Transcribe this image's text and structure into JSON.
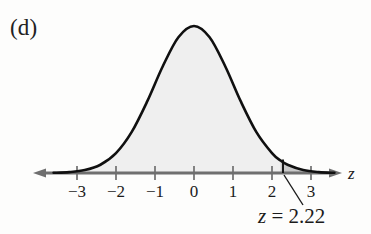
{
  "figure": {
    "panel_label": "(d)",
    "axis_label": "z",
    "annotation_variable": "z",
    "annotation_equals": "=",
    "annotation_value": "2.22",
    "annotation_full": "z = 2.22"
  },
  "colors": {
    "curve_stroke": "#101010",
    "curve_fill": "#efefef",
    "tail_fill": "#c9c9c9",
    "axis": "#6f6f6f",
    "tick": "#6f6f6f",
    "leader": "#1b1b1b",
    "text": "#1b1b1b",
    "background": "#fdfdfc"
  },
  "chart_data": {
    "type": "area",
    "title": "(d)",
    "xlabel": "z",
    "ylabel": "",
    "xlim": [
      -3.6,
      3.8
    ],
    "ylim": [
      0,
      0.42
    ],
    "grid": false,
    "legend": null,
    "distribution": "standard normal",
    "mean": 0,
    "sd": 1,
    "tick_values": [
      -3,
      -2,
      -1,
      0,
      1,
      2,
      3
    ],
    "tick_labels": [
      "−3",
      "−2",
      "−1",
      "0",
      "1",
      "2",
      "3"
    ],
    "shaded_region": {
      "label": "z = 2.22",
      "boundary_z": 2.22,
      "direction": "right tail",
      "fill": "#c9c9c9"
    },
    "curve_points": [
      {
        "z": -3.6,
        "density": 0.0006
      },
      {
        "z": -3.2,
        "density": 0.0024
      },
      {
        "z": -2.8,
        "density": 0.0079
      },
      {
        "z": -2.4,
        "density": 0.0224
      },
      {
        "z": -2.0,
        "density": 0.054
      },
      {
        "z": -1.6,
        "density": 0.1109
      },
      {
        "z": -1.2,
        "density": 0.1942
      },
      {
        "z": -0.8,
        "density": 0.2897
      },
      {
        "z": -0.4,
        "density": 0.3683
      },
      {
        "z": 0.0,
        "density": 0.3989
      },
      {
        "z": 0.4,
        "density": 0.3683
      },
      {
        "z": 0.8,
        "density": 0.2897
      },
      {
        "z": 1.2,
        "density": 0.1942
      },
      {
        "z": 1.6,
        "density": 0.1109
      },
      {
        "z": 2.0,
        "density": 0.054
      },
      {
        "z": 2.22,
        "density": 0.0339
      },
      {
        "z": 2.4,
        "density": 0.0224
      },
      {
        "z": 2.8,
        "density": 0.0079
      },
      {
        "z": 3.2,
        "density": 0.0024
      },
      {
        "z": 3.6,
        "density": 0.0006
      }
    ]
  },
  "geometry": {
    "baseline_y": 173,
    "peak_y": 26,
    "origin_x": 194,
    "unit_px": 39,
    "axis_start_x": 33,
    "axis_end_x": 342,
    "boundary_x": 283
  }
}
